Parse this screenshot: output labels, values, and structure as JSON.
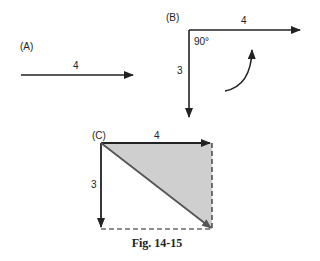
{
  "figure": {
    "caption": "Fig. 14-15",
    "panels": {
      "A": {
        "label": "(A)",
        "vector_label": "4"
      },
      "B": {
        "label": "(B)",
        "horizontal_label": "4",
        "vertical_label": "3",
        "angle_label": "90°"
      },
      "C": {
        "label": "(C)",
        "horizontal_label": "4",
        "vertical_label": "3"
      }
    },
    "colors": {
      "line": "#222222",
      "shade": "#cfcfcf",
      "diagonal": "#555555"
    }
  }
}
